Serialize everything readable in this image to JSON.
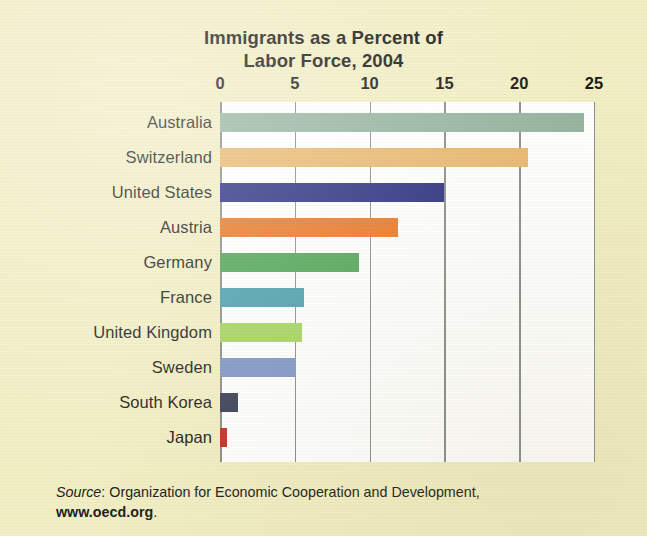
{
  "figure": {
    "background_color": "#f2eec4",
    "plot_background_color": "#ffffff",
    "axis_color": "#8a8f8a",
    "title_line1": "Immigrants as a Percent of",
    "title_line2": "Labor Force, 2004"
  },
  "source": {
    "label": "Source",
    "separator": ": ",
    "organization": "Organization for Economic Cooperation and Development,",
    "url": "www.oecd.org",
    "period": "."
  },
  "chart_data": {
    "type": "bar",
    "orientation": "horizontal",
    "title": "Immigrants as a Percent of Labor Force, 2004",
    "xlabel": "",
    "ylabel": "",
    "xlim": [
      0,
      25
    ],
    "xticks": [
      0,
      5,
      10,
      15,
      20,
      25
    ],
    "xtick_labels": [
      "0",
      "5",
      "10",
      "15",
      "20",
      "25"
    ],
    "grid": true,
    "grid_axis": "x",
    "legend": false,
    "categories": [
      "Australia",
      "Switzerland",
      "United States",
      "Austria",
      "Germany",
      "France",
      "United Kingdom",
      "Sweden",
      "South Korea",
      "Japan"
    ],
    "values": [
      24.3,
      20.6,
      15.0,
      11.9,
      9.3,
      5.6,
      5.5,
      5.1,
      1.2,
      0.5
    ],
    "colors": [
      "#97b5a0",
      "#e8b96f",
      "#2a2f80",
      "#e87726",
      "#4fa455",
      "#4b9fae",
      "#a5d460",
      "#8096c8",
      "#3c4159",
      "#c0352a"
    ],
    "bars": [
      {
        "category": "Australia",
        "value": 24.3,
        "color": "#97b5a0"
      },
      {
        "category": "Switzerland",
        "value": 20.6,
        "color": "#e8b96f"
      },
      {
        "category": "United States",
        "value": 15.0,
        "color": "#2a2f80"
      },
      {
        "category": "Austria",
        "value": 11.9,
        "color": "#e87726"
      },
      {
        "category": "Germany",
        "value": 9.3,
        "color": "#4fa455"
      },
      {
        "category": "France",
        "value": 5.6,
        "color": "#4b9fae"
      },
      {
        "category": "United Kingdom",
        "value": 5.5,
        "color": "#a5d460"
      },
      {
        "category": "Sweden",
        "value": 5.1,
        "color": "#8096c8"
      },
      {
        "category": "South Korea",
        "value": 1.2,
        "color": "#3c4159"
      },
      {
        "category": "Japan",
        "value": 0.5,
        "color": "#c0352a"
      }
    ]
  }
}
